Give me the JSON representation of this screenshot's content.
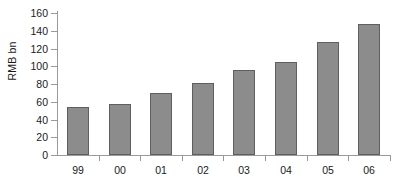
{
  "chart_data": {
    "type": "bar",
    "title": "",
    "xlabel": "",
    "ylabel": "RMB bn",
    "categories": [
      "99",
      "00",
      "01",
      "02",
      "03",
      "04",
      "05",
      "06"
    ],
    "values": [
      54,
      57,
      70,
      81,
      96,
      105,
      127,
      148
    ],
    "ylim": [
      0,
      160
    ],
    "yticks": [
      0,
      20,
      40,
      60,
      80,
      100,
      120,
      140,
      160
    ],
    "ytick_labels": [
      "0",
      "20",
      "40",
      "60",
      "80",
      "100",
      "120",
      "140",
      "160"
    ],
    "grid": false,
    "legend": false,
    "bar_color": "#8c8c8c",
    "bar_edge_color": "#5f5f5f",
    "axis_color": "#9a9a9a",
    "background": "#ffffff"
  }
}
